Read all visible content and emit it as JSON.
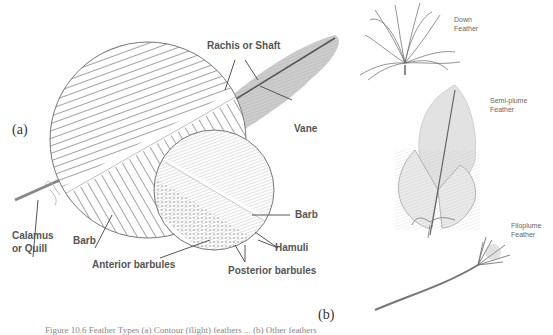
{
  "figure": {
    "panel_a_label": "(a)",
    "panel_b_label": "(b)",
    "caption": "Figure 10.6 Feather Types (a) Contour (flight) feathers ... (b) Other feathers"
  },
  "panel_a": {
    "labels": {
      "rachis": "Rachis or Shaft",
      "vane": "Vane",
      "calamus_line1": "Calamus",
      "calamus_line2": "or Quill",
      "barb_left": "Barb",
      "barb_right": "Barb",
      "hamuli": "Hamuli",
      "anterior_barbules": "Anterior barbules",
      "posterior_barbules": "Posterior barbules"
    }
  },
  "panel_b": {
    "labels": {
      "down": "Down\nFeather",
      "semiplume": "Semi-plume\nFeather",
      "filoplume": "Filoplume\nFeather"
    }
  },
  "colors": {
    "ink": "#555555",
    "sketch": "#8a8a8a",
    "background": "#ffffff"
  }
}
